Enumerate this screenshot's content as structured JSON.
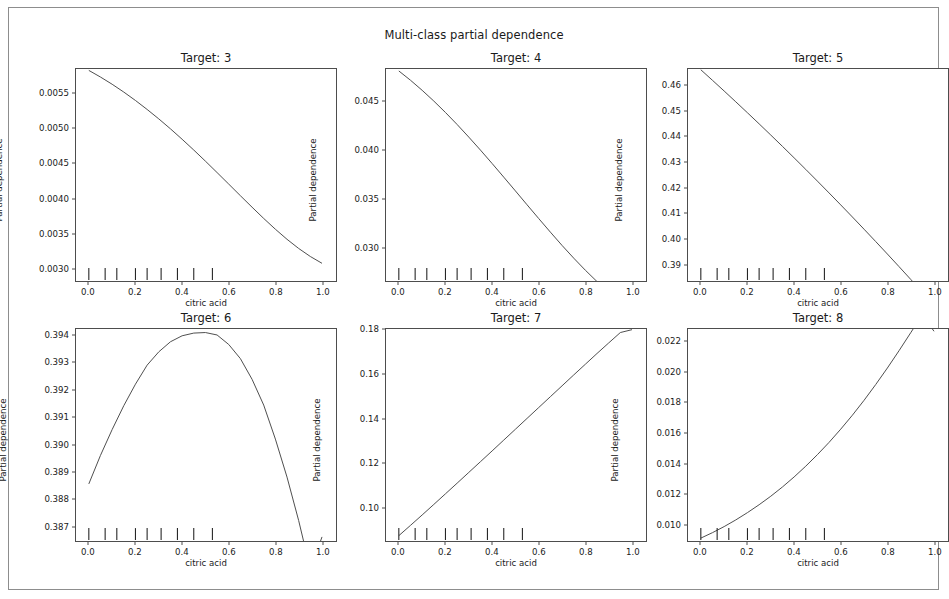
{
  "figure": {
    "suptitle": "Multi-class partial dependence",
    "background": "#ffffff",
    "line_color": "#4d4d4d",
    "frame_color": "#8d8d8d"
  },
  "chart_data": [
    {
      "type": "line",
      "title": "Target: 3",
      "xlabel": "citric acid",
      "ylabel": "Partial dependence",
      "xlim": [
        -0.055,
        1.06
      ],
      "ylim": [
        0.00282,
        0.00585
      ],
      "xticks": [
        "0.0",
        "0.2",
        "0.4",
        "0.6",
        "0.8",
        "1.0"
      ],
      "xtick_values": [
        0.0,
        0.2,
        0.4,
        0.6,
        0.8,
        1.0
      ],
      "yticks": [
        "0.0030",
        "0.0035",
        "0.0040",
        "0.0045",
        "0.0050",
        "0.0055"
      ],
      "ytick_values": [
        0.003,
        0.0035,
        0.004,
        0.0045,
        0.005,
        0.0055
      ],
      "grid": false,
      "legend": "none",
      "deciles": [
        0.0,
        0.07,
        0.12,
        0.2,
        0.25,
        0.31,
        0.38,
        0.45,
        0.53
      ],
      "x": [
        0.0,
        0.05,
        0.1,
        0.15,
        0.2,
        0.25,
        0.3,
        0.35,
        0.4,
        0.45,
        0.5,
        0.55,
        0.6,
        0.65,
        0.7,
        0.75,
        0.8,
        0.85,
        0.9,
        0.95,
        1.0
      ],
      "y": [
        0.00583,
        0.005735,
        0.005632,
        0.00552,
        0.0054,
        0.005272,
        0.005137,
        0.004995,
        0.004846,
        0.004692,
        0.004533,
        0.00437,
        0.004205,
        0.004039,
        0.003875,
        0.003714,
        0.00356,
        0.003416,
        0.003285,
        0.00317,
        0.003073
      ]
    },
    {
      "type": "line",
      "title": "Target: 4",
      "xlabel": "citric acid",
      "ylabel": "Partial dependence",
      "xlim": [
        -0.055,
        1.06
      ],
      "ylim": [
        0.0266,
        0.0483
      ],
      "xticks": [
        "0.0",
        "0.2",
        "0.4",
        "0.6",
        "0.8",
        "1.0"
      ],
      "xtick_values": [
        0.0,
        0.2,
        0.4,
        0.6,
        0.8,
        1.0
      ],
      "yticks": [
        "0.030",
        "0.035",
        "0.040",
        "0.045"
      ],
      "ytick_values": [
        0.03,
        0.035,
        0.04,
        0.045
      ],
      "grid": false,
      "legend": "none",
      "deciles": [
        0.0,
        0.07,
        0.12,
        0.2,
        0.25,
        0.31,
        0.38,
        0.45,
        0.53
      ],
      "x": [
        0.0,
        0.05,
        0.1,
        0.15,
        0.2,
        0.25,
        0.3,
        0.35,
        0.4,
        0.45,
        0.5,
        0.55,
        0.6,
        0.65,
        0.7,
        0.75,
        0.8,
        0.85,
        0.9,
        0.95,
        1.0
      ],
      "y": [
        0.0481,
        0.04715,
        0.04612,
        0.04502,
        0.04385,
        0.04262,
        0.04133,
        0.04,
        0.03863,
        0.03723,
        0.03582,
        0.0344,
        0.03299,
        0.0316,
        0.03024,
        0.02894,
        0.0277,
        0.02654,
        0.02548,
        0.02456,
        0.0238
      ]
    },
    {
      "type": "line",
      "title": "Target: 5",
      "xlabel": "citric acid",
      "ylabel": "Partial dependence",
      "xlim": [
        -0.055,
        1.06
      ],
      "ylim": [
        0.3833,
        0.4666
      ],
      "xticks": [
        "0.0",
        "0.2",
        "0.4",
        "0.6",
        "0.8",
        "1.0"
      ],
      "xtick_values": [
        0.0,
        0.2,
        0.4,
        0.6,
        0.8,
        1.0
      ],
      "yticks": [
        "0.39",
        "0.40",
        "0.41",
        "0.42",
        "0.43",
        "0.44",
        "0.45",
        "0.46"
      ],
      "ytick_values": [
        0.39,
        0.4,
        0.41,
        0.42,
        0.43,
        0.44,
        0.45,
        0.46
      ],
      "grid": false,
      "legend": "none",
      "deciles": [
        0.0,
        0.07,
        0.12,
        0.2,
        0.25,
        0.31,
        0.38,
        0.45,
        0.53
      ],
      "x": [
        0.0,
        0.05,
        0.1,
        0.15,
        0.2,
        0.25,
        0.3,
        0.35,
        0.4,
        0.45,
        0.5,
        0.55,
        0.6,
        0.65,
        0.7,
        0.75,
        0.8,
        0.85,
        0.9,
        0.95,
        1.0
      ],
      "y": [
        0.4663,
        0.46215,
        0.45795,
        0.4537,
        0.4494,
        0.44505,
        0.44065,
        0.4362,
        0.4317,
        0.42715,
        0.42255,
        0.4179,
        0.4132,
        0.40845,
        0.40365,
        0.3988,
        0.3939,
        0.38895,
        0.38395,
        0.3789,
        0.3738
      ]
    },
    {
      "type": "line",
      "title": "Target: 6",
      "xlabel": "citric acid",
      "ylabel": "Partial dependence",
      "xlim": [
        -0.055,
        1.06
      ],
      "ylim": [
        0.38645,
        0.39425
      ],
      "xticks": [
        "0.0",
        "0.2",
        "0.4",
        "0.6",
        "0.8",
        "1.0"
      ],
      "xtick_values": [
        0.0,
        0.2,
        0.4,
        0.6,
        0.8,
        1.0
      ],
      "yticks": [
        "0.387",
        "0.388",
        "0.389",
        "0.390",
        "0.391",
        "0.392",
        "0.393",
        "0.394"
      ],
      "ytick_values": [
        0.387,
        0.388,
        0.389,
        0.39,
        0.391,
        0.392,
        0.393,
        0.394
      ],
      "grid": false,
      "legend": "none",
      "deciles": [
        0.0,
        0.07,
        0.12,
        0.2,
        0.25,
        0.31,
        0.38,
        0.45,
        0.53
      ],
      "x": [
        0.0,
        0.05,
        0.1,
        0.15,
        0.2,
        0.25,
        0.3,
        0.35,
        0.4,
        0.45,
        0.5,
        0.55,
        0.6,
        0.65,
        0.7,
        0.75,
        0.8,
        0.85,
        0.9,
        0.95,
        1.0
      ],
      "y": [
        0.38855,
        0.3896,
        0.39055,
        0.39143,
        0.39222,
        0.39292,
        0.39341,
        0.39378,
        0.394,
        0.3941,
        0.39412,
        0.39403,
        0.39368,
        0.39316,
        0.3924,
        0.39145,
        0.3902,
        0.3888,
        0.3872,
        0.3854,
        0.3866
      ]
    },
    {
      "type": "line",
      "title": "Target: 7",
      "xlabel": "citric acid",
      "ylabel": "Partial dependence",
      "xlim": [
        -0.055,
        1.06
      ],
      "ylim": [
        0.0848,
        0.1805
      ],
      "xticks": [
        "0.0",
        "0.2",
        "0.4",
        "0.6",
        "0.8",
        "1.0"
      ],
      "xtick_values": [
        0.0,
        0.2,
        0.4,
        0.6,
        0.8,
        1.0
      ],
      "yticks": [
        "0.10",
        "0.12",
        "0.14",
        "0.16",
        "0.18"
      ],
      "ytick_values": [
        0.1,
        0.12,
        0.14,
        0.16,
        0.18
      ],
      "grid": false,
      "legend": "none",
      "deciles": [
        0.0,
        0.07,
        0.12,
        0.2,
        0.25,
        0.31,
        0.38,
        0.45,
        0.53
      ],
      "x": [
        0.0,
        0.05,
        0.1,
        0.15,
        0.2,
        0.25,
        0.3,
        0.35,
        0.4,
        0.45,
        0.5,
        0.55,
        0.6,
        0.65,
        0.7,
        0.75,
        0.8,
        0.85,
        0.9,
        0.95,
        1.0
      ],
      "y": [
        0.0872,
        0.09185,
        0.09655,
        0.1013,
        0.1061,
        0.1109,
        0.11575,
        0.1206,
        0.12545,
        0.13035,
        0.13525,
        0.14015,
        0.14505,
        0.14995,
        0.15485,
        0.15975,
        0.1646,
        0.16945,
        0.1742,
        0.1789,
        0.1802
      ]
    },
    {
      "type": "line",
      "title": "Target: 8",
      "xlabel": "citric acid",
      "ylabel": "Partial dependence",
      "xlim": [
        -0.055,
        1.06
      ],
      "ylim": [
        0.00888,
        0.02285
      ],
      "xticks": [
        "0.0",
        "0.2",
        "0.4",
        "0.6",
        "0.8",
        "1.0"
      ],
      "xtick_values": [
        0.0,
        0.2,
        0.4,
        0.6,
        0.8,
        1.0
      ],
      "yticks": [
        "0.010",
        "0.012",
        "0.014",
        "0.016",
        "0.018",
        "0.020",
        "0.022"
      ],
      "ytick_values": [
        0.01,
        0.012,
        0.014,
        0.016,
        0.018,
        0.02,
        0.022
      ],
      "grid": false,
      "legend": "none",
      "deciles": [
        0.0,
        0.07,
        0.12,
        0.2,
        0.25,
        0.31,
        0.38,
        0.45,
        0.53
      ],
      "x": [
        0.0,
        0.05,
        0.1,
        0.15,
        0.2,
        0.25,
        0.3,
        0.35,
        0.4,
        0.45,
        0.5,
        0.55,
        0.6,
        0.65,
        0.7,
        0.75,
        0.8,
        0.85,
        0.9,
        0.95,
        1.0
      ],
      "y": [
        0.00907,
        0.00943,
        0.00983,
        0.01027,
        0.01075,
        0.01127,
        0.01183,
        0.01244,
        0.0131,
        0.01381,
        0.01457,
        0.01538,
        0.01625,
        0.01717,
        0.01815,
        0.01919,
        0.02028,
        0.02142,
        0.0226,
        0.0238,
        0.0227
      ]
    }
  ],
  "panels": [
    {
      "left": 75,
      "top": 68,
      "index": 0
    },
    {
      "left": 385,
      "top": 68,
      "index": 1
    },
    {
      "left": 687,
      "top": 68,
      "index": 2
    },
    {
      "left": 75,
      "top": 328,
      "index": 3
    },
    {
      "left": 385,
      "top": 328,
      "index": 4
    },
    {
      "left": 687,
      "top": 328,
      "index": 5
    }
  ]
}
